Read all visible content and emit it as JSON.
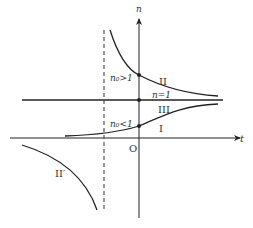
{
  "diagram": {
    "axes": {
      "vertical_label": "n",
      "horizontal_label": "t",
      "origin_label": "O"
    },
    "reference_line_label": "n=1",
    "initial_value_labels": {
      "above": "n₀>1",
      "below": "n₀<1"
    },
    "curve_labels": {
      "upper": "II",
      "middle": "III",
      "lower": "I",
      "mirror": "II′"
    },
    "colors": {
      "stroke": "#222222",
      "text": "#333333",
      "background": "#ffffff"
    }
  }
}
